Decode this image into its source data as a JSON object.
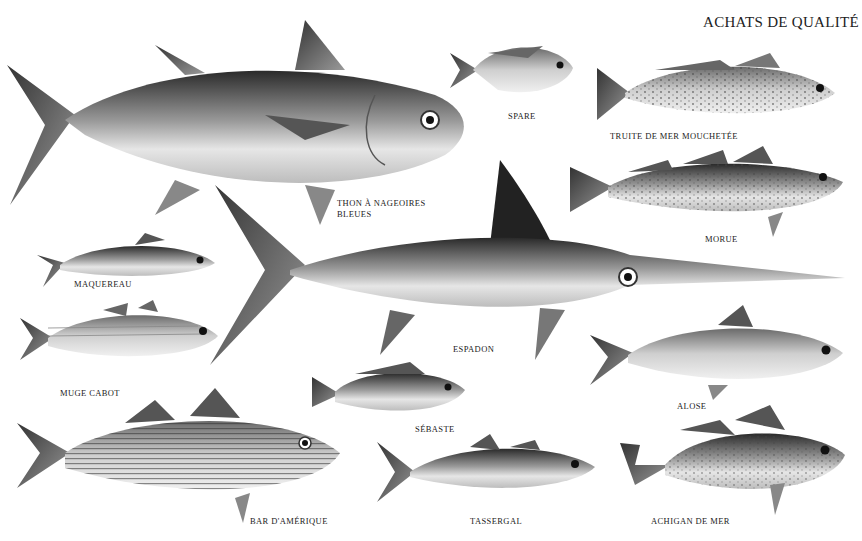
{
  "title": "ACHATS DE QUALITÉ",
  "fish": [
    {
      "id": "thon",
      "label": "THON À NAGEOIRES\nBLEUES"
    },
    {
      "id": "spare",
      "label": "SPARE"
    },
    {
      "id": "truite",
      "label": "TRUITE DE MER MOUCHETÉE"
    },
    {
      "id": "morue",
      "label": "MORUE"
    },
    {
      "id": "maquereau",
      "label": "MAQUEREAU"
    },
    {
      "id": "espadon",
      "label": "ESPADON"
    },
    {
      "id": "muge",
      "label": "MUGE CABOT"
    },
    {
      "id": "alose",
      "label": "ALOSE"
    },
    {
      "id": "sebaste",
      "label": "SÉBASTE"
    },
    {
      "id": "bar",
      "label": "BAR D'AMÉRIQUE"
    },
    {
      "id": "tassergal",
      "label": "TASSERGAL"
    },
    {
      "id": "achigan",
      "label": "ACHIGAN DE MER"
    }
  ]
}
